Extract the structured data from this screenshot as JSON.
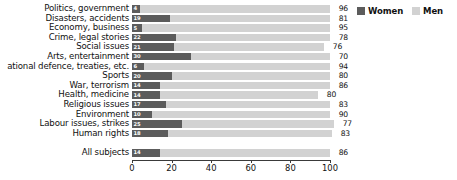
{
  "legend": {
    "position": "top-right",
    "entries": [
      {
        "label": "Women",
        "color": "#5c5c5c",
        "swatch_name": "legend-swatch-women"
      },
      {
        "label": "Men",
        "color": "#d2d2d2",
        "swatch_name": "legend-swatch-men"
      }
    ]
  },
  "chart_data": {
    "type": "bar",
    "orientation": "horizontal",
    "stacked": true,
    "title": "",
    "subtitle": "",
    "xlabel": "",
    "ylabel": "",
    "xlim": [
      0,
      100
    ],
    "xticks": [
      0,
      20,
      40,
      60,
      80,
      100
    ],
    "xtick_labels": [
      "0",
      "20",
      "40",
      "60",
      "80",
      "100"
    ],
    "grid": false,
    "value_labels_inside_bars": true,
    "categories": [
      "Politics, government",
      "Disasters, accidents",
      "Economy, business",
      "Crime, legal stories",
      "Social issues",
      "Arts, entertainment",
      "ational defence, treaties, etc.",
      "Sports",
      "War, terrorism",
      "Health, medicine",
      "Religious issues",
      "Environment",
      "Labour issues, strikes",
      "Human rights"
    ],
    "series": [
      {
        "name": "Women",
        "color": "#5c5c5c",
        "values": [
          4,
          19,
          5,
          22,
          21,
          30,
          6,
          20,
          14,
          14,
          17,
          10,
          25,
          18
        ]
      },
      {
        "name": "Men",
        "color": "#d2d2d2",
        "values": [
          96,
          81,
          95,
          78,
          76,
          70,
          94,
          80,
          86,
          80,
          83,
          90,
          77,
          83
        ]
      }
    ],
    "summary": {
      "category": "All subjects",
      "women": 14,
      "men": 86
    }
  }
}
